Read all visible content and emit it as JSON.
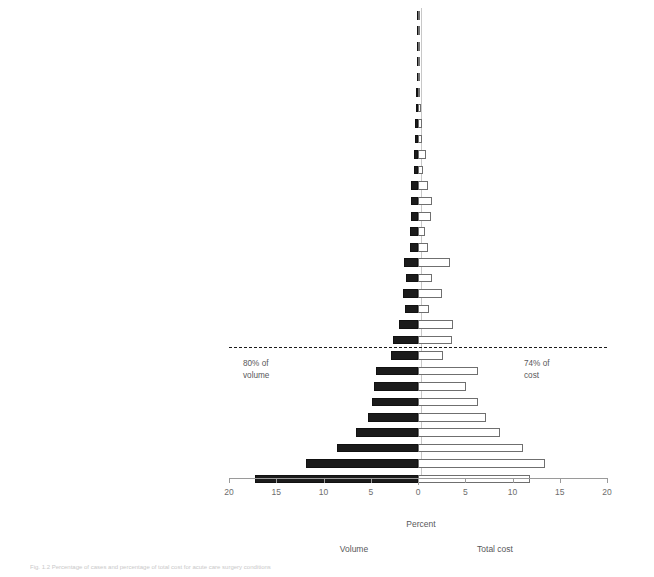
{
  "chart_data": {
    "type": "bar",
    "orientation": "horizontal-diverging",
    "title": "",
    "xlabel": "Percent",
    "ylabel": "",
    "grid": false,
    "xlim": [
      -20,
      20
    ],
    "xticks": [
      20,
      15,
      10,
      5,
      0,
      5,
      10,
      15,
      20
    ],
    "xtick_labels": [
      "20",
      "15",
      "10",
      "5",
      "0",
      "5",
      "10",
      "15",
      "20"
    ],
    "legend_position": "below-axis",
    "series": [
      {
        "name": "Volume",
        "side": "left",
        "color": "#1b1b1b",
        "style": "filled"
      },
      {
        "name": "Total cost",
        "side": "right",
        "color": "#ffffff",
        "style": "outline"
      }
    ],
    "categories": [
      "Shock",
      "Meckles diverticulum",
      "Breast infection",
      "Retroperitoneal infection and abscess",
      "Small intestine cancer",
      "Pneumothorax",
      "Enteric fistula",
      "Esophagus",
      "Empyema chest",
      "Liver",
      "Stoma",
      "Peritnonitis and abscess",
      "Vascular",
      "Support devices",
      "Hemorrhoids",
      "Wounds",
      "Colorectal cancer",
      "Enteritis",
      "Bowel ischemia",
      "Perianal",
      "Hernia",
      "Clostridium difficile",
      "Abdominal pain",
      "Peptic ulcer disease",
      "Gastrointenstinal bleed",
      "Appendix",
      "Diverticular disease",
      "Pancreatitis",
      "Intestinal obstruction",
      "Gall bladder",
      "Soft tissue infection"
    ],
    "volume": [
      0.1,
      0.1,
      0.12,
      0.15,
      0.15,
      0.2,
      0.25,
      0.3,
      0.35,
      0.4,
      0.45,
      0.7,
      0.7,
      0.75,
      0.8,
      0.85,
      1.5,
      1.3,
      1.6,
      1.4,
      2.0,
      2.6,
      2.9,
      4.4,
      4.7,
      4.9,
      5.3,
      6.6,
      8.6,
      11.9,
      17.2
    ],
    "total_cost": [
      0.1,
      0.1,
      0.12,
      0.15,
      0.15,
      0.2,
      0.3,
      0.45,
      0.4,
      0.8,
      0.5,
      1.05,
      1.5,
      1.4,
      0.7,
      1.05,
      3.4,
      1.5,
      2.5,
      1.2,
      3.7,
      3.6,
      2.6,
      6.4,
      5.1,
      6.4,
      7.2,
      8.7,
      11.1,
      13.4,
      11.9
    ],
    "annotations": [
      {
        "text_line1": "80% of",
        "text_line2": "volume",
        "side": "left"
      },
      {
        "text_line1": "74% of",
        "text_line2": "cost",
        "side": "right"
      }
    ],
    "reference_line": {
      "style": "dashed",
      "after_category": "Clostridium difficile"
    }
  },
  "axis": {
    "xlabel": "Percent",
    "ticks": [
      "20",
      "15",
      "10",
      "5",
      "0",
      "5",
      "10",
      "15",
      "20"
    ]
  },
  "legend": {
    "left_label": "Volume",
    "right_label": "Total cost"
  },
  "annotations": {
    "left_line1": "80% of",
    "left_line2": "volume",
    "right_line1": "74% of",
    "right_line2": "cost"
  },
  "caption": "Fig. 1.2 Percentage of cases and percentage of total cost for acute care surgery conditions"
}
